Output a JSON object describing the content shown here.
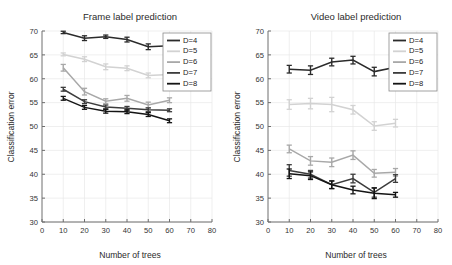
{
  "figure": {
    "background": "#ffffff",
    "width": 452,
    "height": 265
  },
  "panels": [
    {
      "id": "frame",
      "title": "Frame label prediction"
    },
    {
      "id": "video",
      "title": "Video label prediction"
    }
  ],
  "legend": {
    "position": "top-right",
    "entries": [
      {
        "label": "D=4",
        "color": "#2b2b2b"
      },
      {
        "label": "D=5",
        "color": "#d2d2d2"
      },
      {
        "label": "D=6",
        "color": "#a8a8a8"
      },
      {
        "label": "D=7",
        "color": "#3c3c3c"
      },
      {
        "label": "D=8",
        "color": "#141414"
      }
    ]
  },
  "chart_data": [
    {
      "type": "line",
      "id": "frame",
      "title": "Frame label prediction",
      "xlabel": "Number of trees",
      "ylabel": "Classification error",
      "xlim": [
        0,
        80
      ],
      "ylim": [
        30,
        70
      ],
      "xticks": [
        0,
        10,
        20,
        30,
        40,
        50,
        60,
        70,
        80
      ],
      "yticks": [
        30,
        35,
        40,
        45,
        50,
        55,
        60,
        65,
        70
      ],
      "grid": true,
      "x": [
        10,
        20,
        30,
        40,
        50,
        60
      ],
      "series": [
        {
          "name": "D=4",
          "color": "#2b2b2b",
          "values": [
            69.7,
            68.5,
            68.8,
            68.2,
            66.7,
            66.9
          ],
          "errors": [
            0.25,
            0.5,
            0.35,
            0.5,
            0.6,
            0.3
          ]
        },
        {
          "name": "D=5",
          "color": "#d2d2d2",
          "values": [
            65.1,
            64.1,
            62.5,
            62.2,
            60.7,
            60.9
          ],
          "errors": [
            0.3,
            0.5,
            0.6,
            0.5,
            0.5,
            0.4
          ]
        },
        {
          "name": "D=6",
          "color": "#a8a8a8",
          "values": [
            62.3,
            57.3,
            55.3,
            55.9,
            54.5,
            55.5
          ],
          "errors": [
            0.7,
            0.7,
            0.5,
            0.6,
            0.6,
            0.5
          ]
        },
        {
          "name": "D=7",
          "color": "#3c3c3c",
          "values": [
            57.8,
            55.2,
            54.1,
            53.8,
            53.5,
            53.4
          ],
          "errors": [
            0.4,
            0.4,
            0.4,
            0.4,
            0.4,
            0.3
          ]
        },
        {
          "name": "D=8",
          "color": "#141414",
          "values": [
            55.9,
            54.0,
            53.2,
            53.1,
            52.5,
            51.2
          ],
          "errors": [
            0.4,
            0.4,
            0.4,
            0.4,
            0.4,
            0.4
          ]
        }
      ]
    },
    {
      "type": "line",
      "id": "video",
      "title": "Video label prediction",
      "xlabel": "Number of trees",
      "ylabel": "Classification error",
      "xlim": [
        0,
        80
      ],
      "ylim": [
        30,
        70
      ],
      "xticks": [
        0,
        10,
        20,
        30,
        40,
        50,
        60,
        70,
        80
      ],
      "yticks": [
        30,
        35,
        40,
        45,
        50,
        55,
        60,
        65,
        70
      ],
      "grid": true,
      "x": [
        10,
        20,
        30,
        40,
        50,
        60
      ],
      "series": [
        {
          "name": "D=4",
          "color": "#2b2b2b",
          "values": [
            62.0,
            61.8,
            63.5,
            63.9,
            61.5,
            62.4
          ],
          "errors": [
            0.8,
            0.9,
            0.8,
            0.8,
            0.9,
            0.7
          ]
        },
        {
          "name": "D=5",
          "color": "#d2d2d2",
          "values": [
            54.6,
            54.8,
            54.6,
            53.5,
            50.1,
            50.7
          ],
          "errors": [
            1.0,
            1.1,
            1.5,
            0.9,
            0.9,
            0.8
          ]
        },
        {
          "name": "D=6",
          "color": "#a8a8a8",
          "values": [
            45.3,
            42.8,
            42.5,
            44.0,
            40.2,
            40.4
          ],
          "errors": [
            0.8,
            0.9,
            0.9,
            0.9,
            0.8,
            0.8
          ]
        },
        {
          "name": "D=7",
          "color": "#3c3c3c",
          "values": [
            40.8,
            40.0,
            37.8,
            39.1,
            36.2,
            39.1
          ],
          "errors": [
            1.2,
            0.8,
            0.8,
            0.9,
            1.0,
            0.8
          ]
        },
        {
          "name": "D=8",
          "color": "#141414",
          "values": [
            40.1,
            39.7,
            37.8,
            36.7,
            36.0,
            35.7
          ],
          "errors": [
            1.0,
            0.8,
            0.8,
            0.8,
            1.1,
            0.5
          ]
        }
      ]
    }
  ]
}
